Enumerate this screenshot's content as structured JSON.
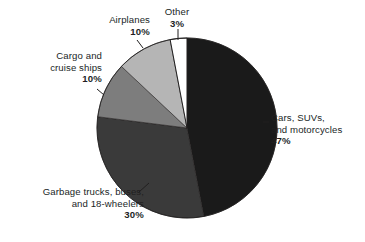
{
  "chart_data": {
    "type": "pie",
    "title": "",
    "subtitle": "",
    "xlabel": "",
    "ylabel": "",
    "legend_position": "none",
    "grid": false,
    "start_angle_deg": 0,
    "direction": "clockwise",
    "units": "percent",
    "total": 100,
    "categories": [
      "Cars, SUVs, and motorcycles",
      "Garbage trucks, buses, and 18-wheelers",
      "Cargo and cruise ships",
      "Airplanes",
      "Other"
    ],
    "values": [
      47,
      30,
      10,
      10,
      3
    ],
    "colors": [
      "#1a1a1a",
      "#3a3a3a",
      "#7d7d7d",
      "#b5b5b5",
      "#ffffff"
    ],
    "slices": [
      {
        "name": "Cars, SUVs, and motorcycles",
        "value": 47,
        "percent_label": "47%",
        "color": "#1a1a1a",
        "label_line1": "Cars, SUVs,",
        "label_line2": "and motorcycles",
        "start_deg": 0,
        "end_deg": 169.2
      },
      {
        "name": "Garbage trucks, buses, and 18-wheelers",
        "value": 30,
        "percent_label": "30%",
        "color": "#3a3a3a",
        "label_line1": "Garbage trucks, buses,",
        "label_line2": "and 18-wheelers",
        "start_deg": 169.2,
        "end_deg": 277.2
      },
      {
        "name": "Cargo and cruise ships",
        "value": 10,
        "percent_label": "10%",
        "color": "#7d7d7d",
        "label_line1": "Cargo and",
        "label_line2": "cruise ships",
        "start_deg": 277.2,
        "end_deg": 313.2
      },
      {
        "name": "Airplanes",
        "value": 10,
        "percent_label": "10%",
        "color": "#b5b5b5",
        "label_line1": "Airplanes",
        "label_line2": "",
        "start_deg": 313.2,
        "end_deg": 349.2
      },
      {
        "name": "Other",
        "value": 3,
        "percent_label": "3%",
        "color": "#ffffff",
        "label_line1": "Other",
        "label_line2": "",
        "start_deg": 349.2,
        "end_deg": 360
      }
    ]
  },
  "geometry": {
    "cx": 187,
    "cy": 128,
    "r": 90
  }
}
